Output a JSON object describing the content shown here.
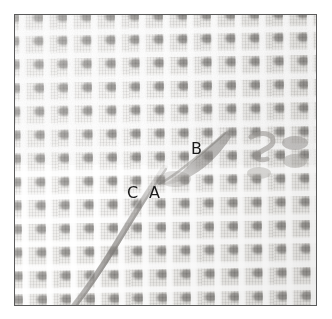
{
  "figure": {
    "kind": "micrograph",
    "colorspace": "grayscale",
    "border_color": "#5a5a5a",
    "matte_color": "#ffffff",
    "panel": {
      "x": 14,
      "y": 14,
      "width": 303,
      "height": 292
    },
    "palette": {
      "background_light": "#f4f3f1",
      "weave_cell_gray": "#9b9996",
      "thread_gap_white": "#fbfbfa",
      "fiber_dark": "#8a8784",
      "label_text": "#1a1a1a"
    }
  },
  "labels": [
    {
      "id": "label-c",
      "text": "C",
      "x": 126,
      "y": 184
    },
    {
      "id": "label-a",
      "text": "A",
      "x": 148,
      "y": 184
    },
    {
      "id": "label-b",
      "text": "B",
      "x": 190,
      "y": 140
    }
  ],
  "features": [
    {
      "id": "fiber-main",
      "name": "dark diagonal fiber",
      "description": "long dark fiber running from mid-field down to the lower-left edge"
    },
    {
      "id": "fiber-wedge",
      "name": "dark wedge inclusion",
      "description": "short dark diagonal inclusion adjacent to labels A and B"
    },
    {
      "id": "weave-flaw",
      "name": "distorted weave cells",
      "description": "irregular, misshapen weave cells near the right edge"
    }
  ],
  "weave": {
    "cell_pitch_x_px": 24,
    "cell_pitch_y_px": 23.5,
    "rotation_deg": -0.8
  }
}
